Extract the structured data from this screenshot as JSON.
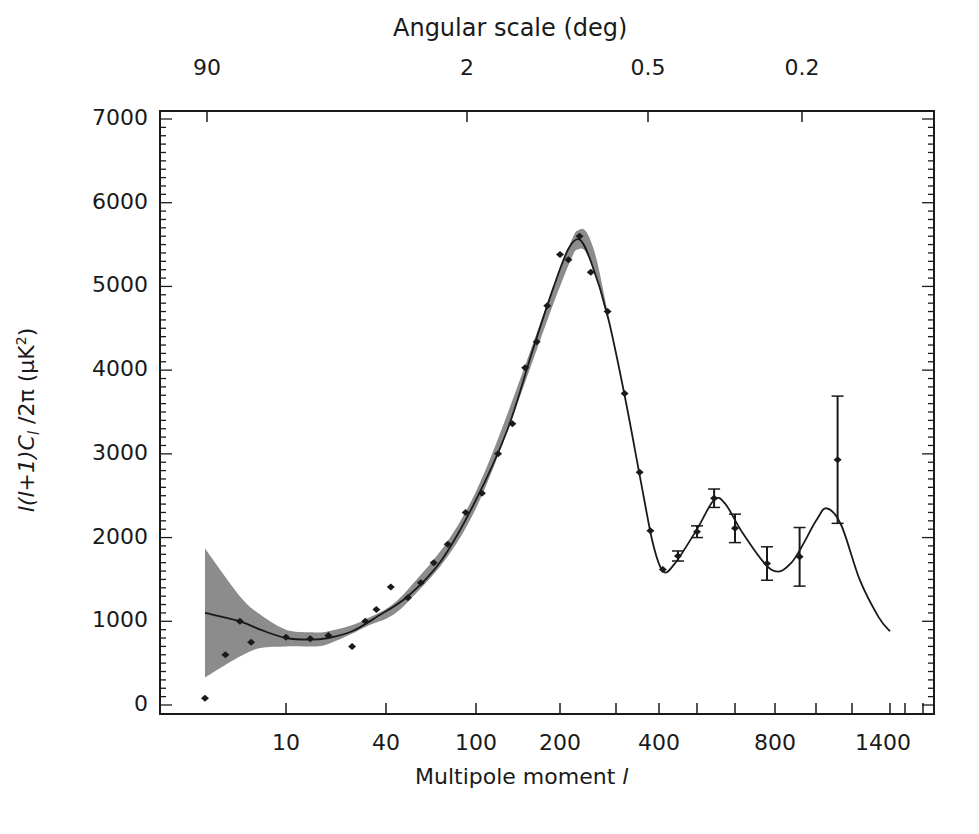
{
  "chart_data": {
    "type": "scatter",
    "title": "Angular scale (deg)",
    "xlabel": "Multipole moment l",
    "ylabel": "l(l+1)C_l /2π (μK²)",
    "ylim": [
      0,
      7000
    ],
    "grid": false,
    "legend": null,
    "x_bottom_ticks": [
      10,
      40,
      100,
      200,
      400,
      800,
      1400
    ],
    "x_top_ticks": [
      "90",
      "2",
      "0.5",
      "0.2"
    ],
    "y_ticks": [
      0,
      1000,
      2000,
      3000,
      4000,
      5000,
      6000,
      7000
    ],
    "series": [
      {
        "name": "data points",
        "type": "scatter_errorbar",
        "points": [
          {
            "l": 2,
            "y": 80
          },
          {
            "l": 3,
            "y": 600
          },
          {
            "l": 4,
            "y": 1000
          },
          {
            "l": 5,
            "y": 750
          },
          {
            "l": 10,
            "y": 810
          },
          {
            "l": 14,
            "y": 790
          },
          {
            "l": 18,
            "y": 830
          },
          {
            "l": 25,
            "y": 700
          },
          {
            "l": 30,
            "y": 1000
          },
          {
            "l": 35,
            "y": 1140
          },
          {
            "l": 42,
            "y": 1410
          },
          {
            "l": 50,
            "y": 1280
          },
          {
            "l": 57,
            "y": 1460
          },
          {
            "l": 65,
            "y": 1700
          },
          {
            "l": 75,
            "y": 1920
          },
          {
            "l": 90,
            "y": 2300
          },
          {
            "l": 105,
            "y": 2530
          },
          {
            "l": 120,
            "y": 3000
          },
          {
            "l": 135,
            "y": 3360
          },
          {
            "l": 150,
            "y": 4030
          },
          {
            "l": 165,
            "y": 4340
          },
          {
            "l": 180,
            "y": 4770
          },
          {
            "l": 200,
            "y": 5380
          },
          {
            "l": 215,
            "y": 5320
          },
          {
            "l": 235,
            "y": 5600
          },
          {
            "l": 255,
            "y": 5170
          },
          {
            "l": 285,
            "y": 4700
          },
          {
            "l": 320,
            "y": 3720
          },
          {
            "l": 355,
            "y": 2780
          },
          {
            "l": 380,
            "y": 2080
          },
          {
            "l": 410,
            "y": 1620
          },
          {
            "l": 450,
            "y": 1780,
            "err": 60
          },
          {
            "l": 500,
            "y": 2070,
            "err": 70
          },
          {
            "l": 545,
            "y": 2470,
            "err": 110
          },
          {
            "l": 600,
            "y": 2110,
            "err": 170
          },
          {
            "l": 680,
            "y": 1690,
            "err": 200
          },
          {
            "l": 760,
            "y": 1770,
            "err": 350
          },
          {
            "l": 860,
            "y": 2930,
            "err": 760
          }
        ]
      },
      {
        "name": "best-fit model",
        "type": "line",
        "points": [
          {
            "l": 2,
            "y": 1100
          },
          {
            "l": 4,
            "y": 1000
          },
          {
            "l": 6,
            "y": 900
          },
          {
            "l": 10,
            "y": 800
          },
          {
            "l": 14,
            "y": 780
          },
          {
            "l": 18,
            "y": 800
          },
          {
            "l": 25,
            "y": 880
          },
          {
            "l": 35,
            "y": 1050
          },
          {
            "l": 50,
            "y": 1300
          },
          {
            "l": 70,
            "y": 1720
          },
          {
            "l": 100,
            "y": 2450
          },
          {
            "l": 130,
            "y": 3300
          },
          {
            "l": 160,
            "y": 4250
          },
          {
            "l": 190,
            "y": 5000
          },
          {
            "l": 215,
            "y": 5450
          },
          {
            "l": 235,
            "y": 5560
          },
          {
            "l": 255,
            "y": 5300
          },
          {
            "l": 285,
            "y": 4650
          },
          {
            "l": 320,
            "y": 3700
          },
          {
            "l": 355,
            "y": 2750
          },
          {
            "l": 385,
            "y": 1950
          },
          {
            "l": 410,
            "y": 1600
          },
          {
            "l": 440,
            "y": 1680
          },
          {
            "l": 500,
            "y": 2100
          },
          {
            "l": 545,
            "y": 2450
          },
          {
            "l": 575,
            "y": 2400
          },
          {
            "l": 620,
            "y": 2050
          },
          {
            "l": 690,
            "y": 1620
          },
          {
            "l": 740,
            "y": 1700
          },
          {
            "l": 800,
            "y": 2200
          },
          {
            "l": 830,
            "y": 2350
          },
          {
            "l": 870,
            "y": 2150
          },
          {
            "l": 920,
            "y": 1500
          },
          {
            "l": 970,
            "y": 1050
          },
          {
            "l": 1000,
            "y": 880
          }
        ]
      },
      {
        "name": "cosmic variance band",
        "type": "area",
        "upper": [
          {
            "l": 2,
            "y": 1870
          },
          {
            "l": 4,
            "y": 1300
          },
          {
            "l": 6,
            "y": 1080
          },
          {
            "l": 10,
            "y": 900
          },
          {
            "l": 14,
            "y": 870
          },
          {
            "l": 18,
            "y": 880
          },
          {
            "l": 30,
            "y": 1020
          },
          {
            "l": 50,
            "y": 1380
          },
          {
            "l": 100,
            "y": 2550
          },
          {
            "l": 200,
            "y": 5200
          },
          {
            "l": 235,
            "y": 5680
          },
          {
            "l": 260,
            "y": 5450
          },
          {
            "l": 285,
            "y": 4700
          }
        ],
        "lower": [
          {
            "l": 2,
            "y": 330
          },
          {
            "l": 4,
            "y": 580
          },
          {
            "l": 6,
            "y": 680
          },
          {
            "l": 10,
            "y": 700
          },
          {
            "l": 14,
            "y": 700
          },
          {
            "l": 18,
            "y": 730
          },
          {
            "l": 30,
            "y": 930
          },
          {
            "l": 50,
            "y": 1230
          },
          {
            "l": 100,
            "y": 2350
          },
          {
            "l": 200,
            "y": 5000
          },
          {
            "l": 235,
            "y": 5450
          },
          {
            "l": 260,
            "y": 5200
          },
          {
            "l": 285,
            "y": 4600
          }
        ]
      }
    ]
  },
  "axes": {
    "title": "Angular scale (deg)",
    "xlabel_text": "Multipole moment ",
    "xlabel_symbol": "l",
    "ylabel_text": "l(l+1)C",
    "ylabel_sub": "l",
    "ylabel_rest": " /2π (μK",
    "ylabel_sup": "2",
    "ylabel_close": ")",
    "y_ticks": [
      "7000",
      "6000",
      "5000",
      "4000",
      "3000",
      "2000",
      "1000",
      "0"
    ],
    "x_ticks": [
      "10",
      "40",
      "100",
      "200",
      "400",
      "800",
      "1400"
    ],
    "top_ticks": [
      "90",
      "2",
      "0.5",
      "0.2"
    ]
  },
  "colors": {
    "ink": "#1a1a1a",
    "band": "#8c8c8c",
    "background": "#ffffff"
  }
}
